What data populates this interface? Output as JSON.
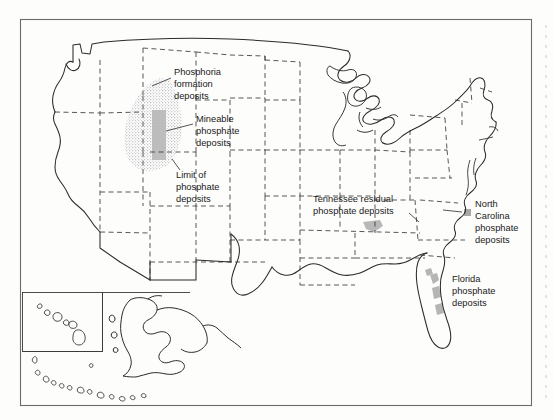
{
  "figure": {
    "type": "map",
    "region": "United States",
    "background_color": "#fdfdfc",
    "frame_color": "#555555",
    "outline_color": "#2b2b2b",
    "state_border_style": "dashed",
    "deposit_fill_color": "#a8a8a8",
    "stipple_color": "#8d8d8d"
  },
  "frame": {
    "x": 20,
    "y": 19,
    "width": 512,
    "height": 387
  },
  "annotations": [
    {
      "id": "phosphoria",
      "lines": [
        "Phosphoria",
        "formation",
        "deposits"
      ],
      "anchor_x": 174,
      "anchor_y": 74,
      "align": "start",
      "leader": "M171,78 L152,86"
    },
    {
      "id": "mineable",
      "lines": [
        "Mineable",
        "phosphate",
        "deposits"
      ],
      "anchor_x": 196,
      "anchor_y": 121,
      "align": "start",
      "leader": "M193,124 L166,131"
    },
    {
      "id": "limit",
      "lines": [
        "Limit of",
        "phosphate",
        "deposits"
      ],
      "anchor_x": 176,
      "anchor_y": 177,
      "align": "start",
      "leader": "M180,171 L171,160"
    },
    {
      "id": "tennessee",
      "lines": [
        "Tennessee residual",
        "phosphate deposits"
      ],
      "anchor_x": 313,
      "anchor_y": 200,
      "align": "start",
      "leader": "M409,213 L418,222"
    },
    {
      "id": "north-carolina",
      "lines": [
        "North",
        "Carolina",
        "phosphate",
        "deposits"
      ],
      "anchor_x": 475,
      "anchor_y": 205,
      "align": "start",
      "leader": "M443,209 L463,212"
    },
    {
      "id": "florida",
      "lines": [
        "Florida",
        "phosphate",
        "deposits"
      ],
      "anchor_x": 452,
      "anchor_y": 280,
      "align": "start",
      "leader": ""
    }
  ],
  "deposits": [
    {
      "id": "phosphoria-stipple",
      "label": "Phosphoria formation deposits (stippled)"
    },
    {
      "id": "mineable-band",
      "label": "Mineable phosphate deposits (solid gray band)"
    },
    {
      "id": "tennessee-patch",
      "label": "Tennessee residual phosphate deposits"
    },
    {
      "id": "north-carolina-patch",
      "label": "North Carolina phosphate deposits"
    },
    {
      "id": "florida-patch",
      "label": "Florida phosphate deposits"
    }
  ],
  "insets": [
    {
      "id": "hawaii",
      "x": 22,
      "y": 292,
      "width": 80,
      "height": 59
    },
    {
      "id": "alaska",
      "x": 102,
      "y": 292,
      "width": 150,
      "height": 110
    }
  ]
}
